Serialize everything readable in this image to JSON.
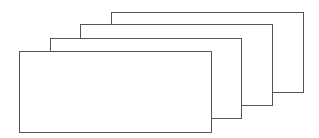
{
  "diagram": {
    "type": "stacked-rectangles",
    "line_color": "#555555",
    "fill_color": "#ffffff",
    "cards": [
      {
        "id": "card-4",
        "left": 111,
        "top": 12,
        "right": 303,
        "bottom": 92
      },
      {
        "id": "card-3",
        "left": 80,
        "top": 24,
        "right": 272,
        "bottom": 105
      },
      {
        "id": "card-2",
        "left": 50,
        "top": 38,
        "right": 241,
        "bottom": 118
      },
      {
        "id": "card-1",
        "left": 19,
        "top": 51,
        "right": 211,
        "bottom": 132
      }
    ]
  }
}
